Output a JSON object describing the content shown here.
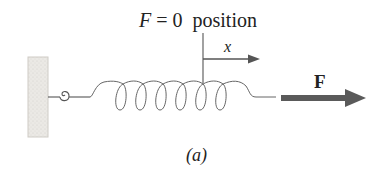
{
  "figure": {
    "title_italic": "F",
    "title_rest": " = 0  position",
    "x_axis_label": "x",
    "force_label": "F",
    "caption": "(a)"
  },
  "colors": {
    "stroke": "#555555",
    "wall_fill": "#e8e6e2",
    "force_arrow": "#555555",
    "text": "#222222"
  },
  "elements": {
    "wall": "fixed wall support",
    "hook": "hook attachment",
    "spring": "coil spring with 6 loops",
    "reference_line": "F = 0 equilibrium position marker",
    "x_arrow": "displacement axis arrow",
    "force_arrow": "applied force arrow"
  }
}
